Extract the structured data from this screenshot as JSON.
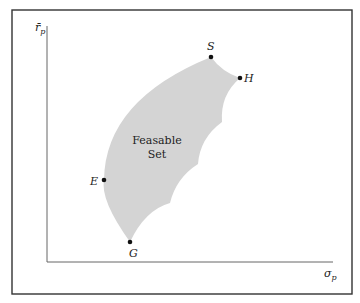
{
  "diagram": {
    "title": "",
    "y_axis_label": "r̄",
    "y_axis_sub": "p",
    "x_axis_label": "σ",
    "x_axis_sub": "p",
    "region_label_line1": "Feasable",
    "region_label_line2": "Set",
    "points": [
      {
        "name": "S",
        "label": "S"
      },
      {
        "name": "H",
        "label": "H"
      },
      {
        "name": "E",
        "label": "E"
      },
      {
        "name": "G",
        "label": "G"
      }
    ],
    "colors": {
      "region_fill": "#d4d4d4",
      "axis": "#666666",
      "border": "#333333",
      "point": "#111111"
    }
  }
}
